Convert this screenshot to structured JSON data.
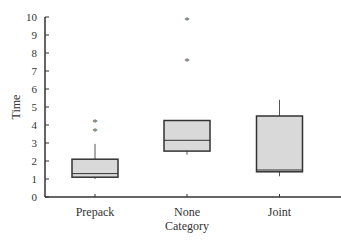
{
  "chart_data": {
    "type": "boxplot",
    "title": "",
    "xlabel": "Category",
    "ylabel": "Time",
    "ylim": [
      0,
      10
    ],
    "yticks": [
      0,
      1,
      2,
      3,
      4,
      5,
      6,
      7,
      8,
      9,
      10
    ],
    "grid": false,
    "legend": null,
    "categories": [
      "Prepack",
      "None",
      "Joint"
    ],
    "boxes": [
      {
        "category": "Prepack",
        "whisker_low": 1.0,
        "q1": 1.1,
        "median": 1.3,
        "q3": 2.1,
        "whisker_high": 2.95,
        "outliers": [
          3.7,
          4.2
        ]
      },
      {
        "category": "None",
        "whisker_low": 2.35,
        "q1": 2.55,
        "median": 3.15,
        "q3": 4.25,
        "whisker_high": 4.25,
        "outliers": [
          7.6,
          9.9
        ]
      },
      {
        "category": "Joint",
        "whisker_low": 1.15,
        "q1": 1.4,
        "median": 1.5,
        "q3": 4.5,
        "whisker_high": 5.4,
        "outliers": []
      }
    ],
    "colors": {
      "box_fill": "#d9d9d9",
      "box_stroke": "#333333",
      "axis": "#333333"
    }
  }
}
